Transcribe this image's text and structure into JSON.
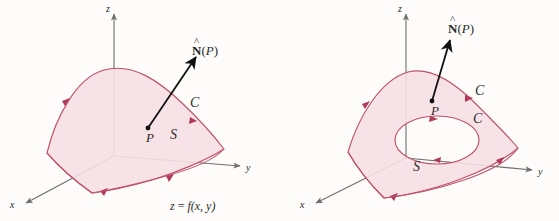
{
  "figure": {
    "title": "",
    "background_color": "#fdfcfa",
    "panels": [
      {
        "id": "left",
        "name": "surface-without-hole",
        "description": "Oriented surface S that is the graph z = f(x,y), with unit normal N-hat(P) at point P and boundary curve C",
        "axes": {
          "z_label": "z",
          "y_label": "y",
          "x_label": "x"
        },
        "labels": {
          "normal_vector": {
            "bold": "N",
            "hat": "^",
            "arg": "(P)"
          },
          "point": "P",
          "surface": "S",
          "curve": "C",
          "equation": {
            "lhs": "z",
            "eq": "=",
            "rhs_fn": "f",
            "rhs_args": "(x, y)"
          }
        }
      },
      {
        "id": "right",
        "name": "surface-with-hole",
        "description": "Oriented surface S with an interior hole; unit normal N-hat(P) at P, outer boundary curve C and inner boundary curve C",
        "axes": {
          "z_label": "z",
          "y_label": "y",
          "x_label": "x"
        },
        "labels": {
          "normal_vector": {
            "bold": "N",
            "hat": "^",
            "arg": "(P)"
          },
          "point": "P",
          "surface": "S",
          "curve_outer": "C",
          "curve_inner": "C"
        }
      }
    ]
  },
  "colors": {
    "surface_fill": "#f6dfe4",
    "surface_edge": "#c0506b",
    "arrowhead": "#b03a58",
    "axis": "#6f6f6f",
    "normal_vector": "#1a1a1a",
    "label_text": "#2b2b2b",
    "background": "#fdfcfa"
  }
}
